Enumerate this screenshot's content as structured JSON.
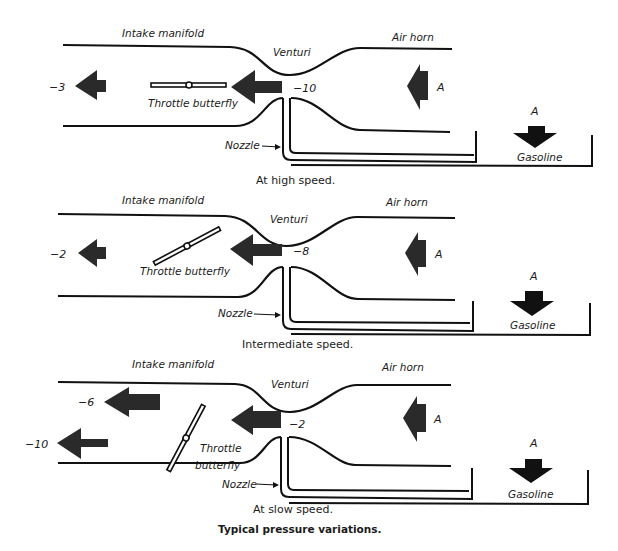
{
  "figure_title": "Typical pressure variations.",
  "panels": [
    {
      "caption": "At high speed.",
      "labels": {
        "intake": "Intake manifold",
        "venturi": "Venturi",
        "air_horn": "Air horn",
        "throttle": "Throttle butterfly",
        "nozzle": "Nozzle",
        "gasoline": "Gasoline",
        "atm_air": "A",
        "atm_fuel": "A"
      },
      "pressures": {
        "manifold": "−3",
        "venturi": "−10"
      },
      "throttle_position": "wide open (horizontal)"
    },
    {
      "caption": "Intermediate speed.",
      "labels": {
        "intake": "Intake manifold",
        "venturi": "Venturi",
        "air_horn": "Air horn",
        "throttle": "Throttle butterfly",
        "nozzle": "Nozzle",
        "gasoline": "Gasoline",
        "atm_air": "A",
        "atm_fuel": "A"
      },
      "pressures": {
        "manifold": "−2",
        "venturi": "−8"
      },
      "throttle_position": "partly open (angled)"
    },
    {
      "caption": "At slow speed.",
      "labels": {
        "intake": "Intake manifold",
        "venturi": "Venturi",
        "air_horn": "Air horn",
        "throttle_line1": "Throttle",
        "throttle_line2": "butterfly",
        "nozzle": "Nozzle",
        "gasoline": "Gasoline",
        "atm_air": "A",
        "atm_fuel": "A"
      },
      "pressures": {
        "manifold_upper": "−6",
        "manifold_lower": "−10",
        "venturi": "−2"
      },
      "throttle_position": "nearly closed (steep)"
    }
  ],
  "colors": {
    "ink": "#111111",
    "arrow": "#2a2a2a",
    "background": "#ffffff"
  }
}
